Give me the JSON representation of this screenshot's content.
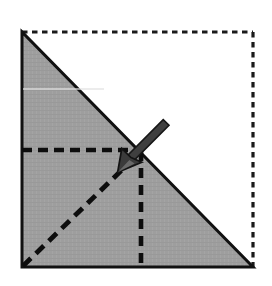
{
  "figure": {
    "caption": "",
    "canvas": {
      "width": 272,
      "height": 286,
      "background": "#ffffff"
    },
    "colors": {
      "paper_fill": "#9e9e9e",
      "paper_fill_shade": "#a3a3a3",
      "outline_stroke": "#111111",
      "fold_line_stroke": "#0d0d0d",
      "ghost_outline_stroke": "#1a1a1a",
      "arrow_fill": "#3b3b3b",
      "arrow_stroke": "#171717",
      "highlight_line": "#e8e8e8"
    },
    "square": {
      "name": "original-sheet-outline",
      "style": "dotted",
      "x1": 22,
      "y1": 32,
      "x2": 253,
      "y2": 267
    },
    "triangle": {
      "name": "folded-paper-triangle",
      "style": "solid-filled",
      "points": "22,32 22,267 253,267",
      "vertices": [
        {
          "label": "top-left",
          "x": 22,
          "y": 32
        },
        {
          "label": "bottom-left",
          "x": 22,
          "y": 267
        },
        {
          "label": "bottom-right",
          "x": 253,
          "y": 267
        }
      ]
    },
    "fold_lines": [
      {
        "name": "horizontal-fold-line",
        "orientation": "horizontal",
        "style": "dashed",
        "x1": 22,
        "y1": 150,
        "x2": 141,
        "y2": 150
      },
      {
        "name": "vertical-fold-line",
        "orientation": "vertical",
        "style": "dashed",
        "x1": 141,
        "y1": 152,
        "x2": 141,
        "y2": 266
      },
      {
        "name": "diagonal-fold-line",
        "orientation": "diagonal",
        "style": "dashed",
        "x1": 23,
        "y1": 266,
        "x2": 126,
        "y2": 166
      }
    ],
    "arrow": {
      "name": "fold-direction-arrow",
      "direction": "down-left",
      "tail": {
        "x": 166,
        "y": 123
      },
      "tip": {
        "x": 118,
        "y": 172
      },
      "shaft_width": 7,
      "head_length": 20,
      "head_width": 19
    },
    "scan_artifact": {
      "name": "scan-highlight-line",
      "x1": 22,
      "y1": 89,
      "x2": 104,
      "y2": 89
    }
  }
}
